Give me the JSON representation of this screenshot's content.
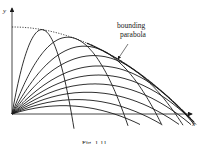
{
  "figure": {
    "axis_x_label": "x",
    "axis_y_label": "y",
    "annotation_line1": "bounding",
    "annotation_line2": "parabola",
    "caption": "Fig. 1.11"
  },
  "geometry": {
    "origin": [
      12,
      114
    ],
    "H": 87,
    "angles_deg": [
      18,
      24,
      30,
      36,
      42,
      48,
      55,
      62,
      70,
      80
    ],
    "min_y": -10
  },
  "colors": {
    "ink": "#1a1a1a"
  }
}
